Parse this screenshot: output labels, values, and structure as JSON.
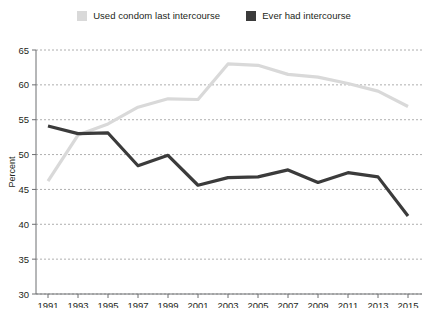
{
  "legend": {
    "position": "top-center",
    "items": [
      {
        "label": "Used condom last intercourse",
        "color": "#d9d9d9",
        "swatch": "legend-swatch-condom"
      },
      {
        "label": "Ever had intercourse",
        "color": "#3b3b3b",
        "swatch": "legend-swatch-intercourse"
      }
    ]
  },
  "axes": {
    "ylabel": "Percent",
    "yticks": [
      "65",
      "60",
      "55",
      "50",
      "45",
      "40",
      "35",
      "30"
    ],
    "xticks": [
      "1991",
      "1993",
      "1995",
      "1997",
      "1999",
      "2001",
      "2003",
      "2005",
      "2007",
      "2009",
      "2011",
      "2013",
      "2015"
    ]
  },
  "footer": {
    "source": ""
  },
  "chart_data": {
    "type": "line",
    "title": "",
    "subtitle": "",
    "xlabel": "",
    "ylabel": "Percent",
    "xlim": [
      1991,
      2015
    ],
    "ylim": [
      30,
      65
    ],
    "ytick_step": 5,
    "xtick_step": 2,
    "grid": "horizontal-dashed",
    "legend_position": "top-center",
    "x": [
      1991,
      1993,
      1995,
      1997,
      1999,
      2001,
      2003,
      2005,
      2007,
      2009,
      2011,
      2013,
      2015
    ],
    "series": [
      {
        "name": "Used condom last intercourse",
        "color": "#d9d9d9",
        "values": [
          46.2,
          52.8,
          54.4,
          56.8,
          58.0,
          57.9,
          63.0,
          62.8,
          61.5,
          61.1,
          60.2,
          59.1,
          56.9
        ]
      },
      {
        "name": "Ever had intercourse",
        "color": "#3b3b3b",
        "values": [
          54.1,
          53.0,
          53.1,
          48.4,
          49.9,
          45.6,
          46.7,
          46.8,
          47.8,
          46.0,
          47.4,
          46.8,
          41.2
        ]
      }
    ]
  }
}
